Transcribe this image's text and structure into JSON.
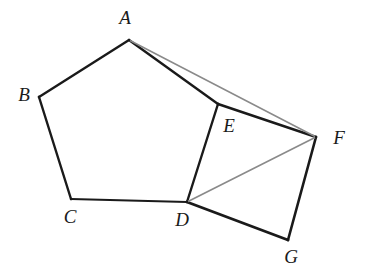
{
  "figure": {
    "background_color": "#ffffff",
    "width": 370,
    "height": 280,
    "stroke_dark": "#1a1a1a",
    "stroke_gray": "#8a8a8a",
    "vertices": [
      {
        "id": "A",
        "label": "A",
        "x": 129,
        "y": 40,
        "label_x": 125,
        "label_y": 17
      },
      {
        "id": "B",
        "label": "B",
        "x": 39,
        "y": 97,
        "label_x": 24,
        "label_y": 94
      },
      {
        "id": "C",
        "label": "C",
        "x": 71,
        "y": 199,
        "label_x": 70,
        "label_y": 216
      },
      {
        "id": "D",
        "label": "D",
        "x": 187,
        "y": 202,
        "label_x": 182,
        "label_y": 219
      },
      {
        "id": "E",
        "label": "E",
        "x": 218,
        "y": 104,
        "label_x": 229,
        "label_y": 125
      },
      {
        "id": "F",
        "label": "F",
        "x": 316,
        "y": 137,
        "label_x": 339,
        "label_y": 137
      },
      {
        "id": "G",
        "label": "G",
        "x": 288,
        "y": 240,
        "label_x": 291,
        "label_y": 256
      }
    ],
    "edges": [
      {
        "id": "A-B",
        "from": "A",
        "to": "B",
        "style": "solid-dark",
        "width": 2.4
      },
      {
        "id": "B-C",
        "from": "B",
        "to": "C",
        "style": "solid-dark",
        "width": 2.4
      },
      {
        "id": "C-D",
        "from": "C",
        "to": "D",
        "style": "solid-dark",
        "width": 1.9
      },
      {
        "id": "D-E",
        "from": "D",
        "to": "E",
        "style": "solid-dark",
        "width": 2.4
      },
      {
        "id": "E-A",
        "from": "E",
        "to": "A",
        "style": "solid-dark",
        "width": 2.4
      },
      {
        "id": "E-F",
        "from": "E",
        "to": "F",
        "style": "solid-dark",
        "width": 2.4
      },
      {
        "id": "F-G",
        "from": "F",
        "to": "G",
        "style": "solid-dark",
        "width": 2.6
      },
      {
        "id": "G-D",
        "from": "G",
        "to": "D",
        "style": "solid-dark",
        "width": 2.8
      },
      {
        "id": "A-F",
        "from": "A",
        "to": "F",
        "style": "solid-gray",
        "width": 1.5
      },
      {
        "id": "D-F",
        "from": "D",
        "to": "F",
        "style": "solid-gray",
        "width": 1.6
      }
    ]
  }
}
